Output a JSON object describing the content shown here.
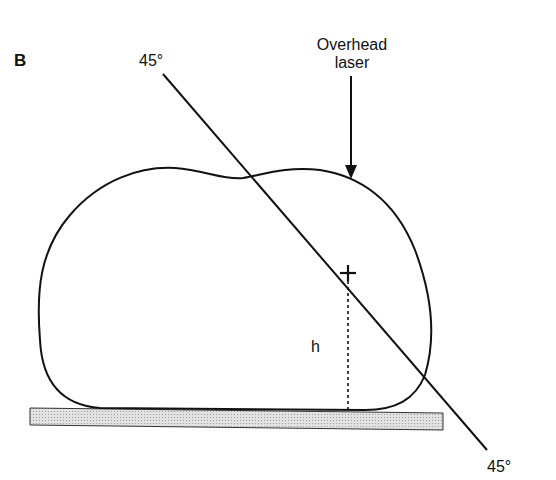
{
  "panel_label": "B",
  "angle_top_label": "45°",
  "angle_bottom_label": "45°",
  "laser_label_line1": "Overhead",
  "laser_label_line2": "laser",
  "height_label": "h",
  "colors": {
    "stroke": "#111111",
    "table_fill": "#d9d9d9",
    "background": "#ffffff"
  }
}
